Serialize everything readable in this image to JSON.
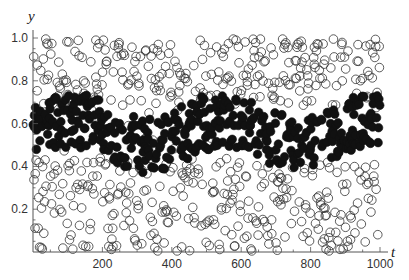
{
  "chart_data": {
    "type": "scatter",
    "title": "",
    "xlabel": "t",
    "ylabel": "y",
    "xlim": [
      0,
      1000
    ],
    "ylim": [
      0,
      1.0
    ],
    "grid": false,
    "legend": "none",
    "x_ticks": [
      200,
      400,
      600,
      800,
      1000
    ],
    "x_tick_labels": [
      "200",
      "400",
      "600",
      "800",
      "1000"
    ],
    "y_ticks": [
      0.2,
      0.4,
      0.6,
      0.8,
      1.0
    ],
    "y_tick_labels": [
      "0.2",
      "0.4",
      "0.6",
      "0.8",
      "1.0"
    ],
    "series": [
      {
        "name": "open circles (uniformly scattered)",
        "marker": "open-circle",
        "color": "#222222",
        "description": "Points spread uniformly over y in [0,1] for t in [0,1000], sparse inside the band occupied by filled points",
        "count_approx": 600
      },
      {
        "name": "filled circles (clustered band)",
        "marker": "filled-circle",
        "color": "#111111",
        "description": "Points concentrated in a band y≈0.40–0.72 for t in [0,1000]",
        "y_range": [
          0.38,
          0.75
        ],
        "count_approx": 400
      }
    ]
  },
  "axes": {
    "x_label": "t",
    "y_label": "y",
    "x_tick_labels": [
      "200",
      "400",
      "600",
      "800",
      "1000"
    ],
    "y_tick_labels": [
      "0.2",
      "0.4",
      "0.6",
      "0.8",
      "1.0"
    ]
  },
  "layout": {
    "x0_px": 33,
    "x1000_px": 380,
    "y0_px": 252,
    "y1_px": 38,
    "marker_radius": 4.3,
    "seed": 12345
  }
}
